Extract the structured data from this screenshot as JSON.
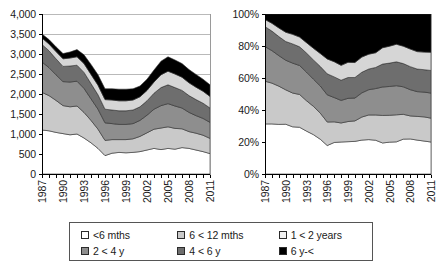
{
  "chart_data": [
    {
      "id": "absolute",
      "type": "area",
      "stacked": true,
      "title": "",
      "xlabel": "",
      "ylabel": "",
      "ylim": [
        0,
        4000
      ],
      "yticks": [
        0,
        500,
        1000,
        1500,
        2000,
        2500,
        3000,
        3500,
        4000
      ],
      "ytick_labels": [
        "0",
        "500",
        "1,000",
        "1,500",
        "2,000",
        "2,500",
        "3,000",
        "3,500",
        "4,000"
      ],
      "grid": true,
      "legend_position": "bottom",
      "x": [
        1987,
        1988,
        1989,
        1990,
        1991,
        1992,
        1993,
        1994,
        1995,
        1996,
        1997,
        1998,
        1999,
        2000,
        2001,
        2002,
        2003,
        2004,
        2005,
        2006,
        2007,
        2008,
        2009,
        2010,
        2011
      ],
      "xtick_labels": [
        "1987",
        "1990",
        "1993",
        "1996",
        "1999",
        "2002",
        "2005",
        "2008",
        "2011"
      ],
      "xticks": [
        1987,
        1990,
        1993,
        1996,
        1999,
        2002,
        2005,
        2008,
        2011
      ],
      "series": [
        {
          "name": "<6 mths",
          "color": "#ffffff",
          "values": [
            1100,
            1080,
            1040,
            1010,
            980,
            1000,
            900,
            780,
            640,
            460,
            520,
            540,
            530,
            540,
            560,
            600,
            640,
            610,
            640,
            620,
            660,
            640,
            600,
            560,
            510
          ]
        },
        {
          "name": "6<12 mths",
          "color": "#c9c9c9",
          "values": [
            940,
            880,
            800,
            700,
            700,
            700,
            640,
            560,
            480,
            380,
            340,
            320,
            330,
            340,
            380,
            430,
            480,
            540,
            540,
            520,
            470,
            420,
            420,
            410,
            380
          ]
        },
        {
          "name": "1<2 years",
          "color": "#8e8e8e",
          "values": [
            760,
            700,
            640,
            600,
            620,
            620,
            600,
            540,
            500,
            440,
            400,
            380,
            380,
            380,
            400,
            440,
            500,
            560,
            580,
            560,
            520,
            480,
            440,
            420,
            400
          ]
        },
        {
          "name": "2<4 y",
          "color": "#6e6e6e",
          "values": [
            440,
            420,
            400,
            380,
            400,
            400,
            400,
            380,
            360,
            340,
            340,
            340,
            340,
            340,
            340,
            360,
            400,
            450,
            470,
            460,
            440,
            420,
            400,
            380,
            360
          ]
        },
        {
          "name": "4<6 y",
          "color": "#d6d6d6",
          "values": [
            160,
            170,
            180,
            190,
            200,
            210,
            220,
            230,
            240,
            240,
            250,
            250,
            250,
            250,
            250,
            260,
            280,
            320,
            340,
            340,
            330,
            320,
            310,
            300,
            290
          ]
        },
        {
          "name": "6 y-<",
          "color": "#000000",
          "values": [
            100,
            110,
            120,
            130,
            150,
            180,
            220,
            250,
            260,
            270,
            280,
            290,
            290,
            280,
            270,
            280,
            300,
            340,
            360,
            350,
            340,
            330,
            320,
            300,
            290
          ]
        }
      ]
    },
    {
      "id": "percentage",
      "type": "area",
      "stacked": true,
      "title": "",
      "xlabel": "",
      "ylabel": "",
      "ylim": [
        0,
        100
      ],
      "yticks": [
        0,
        20,
        40,
        60,
        80,
        100
      ],
      "ytick_labels": [
        "0%",
        "20%",
        "40%",
        "60%",
        "80%",
        "100%"
      ],
      "grid": false,
      "legend_position": "bottom",
      "x": [
        1987,
        1988,
        1989,
        1990,
        1991,
        1992,
        1993,
        1994,
        1995,
        1996,
        1997,
        1998,
        1999,
        2000,
        2001,
        2002,
        2003,
        2004,
        2005,
        2006,
        2007,
        2008,
        2009,
        2010,
        2011
      ],
      "xtick_labels": [
        "1987",
        "1990",
        "1993",
        "1996",
        "1999",
        "2002",
        "2005",
        "2008",
        "2011"
      ],
      "xticks": [
        1987,
        1990,
        1993,
        1996,
        1999,
        2002,
        2005,
        2008,
        2011
      ],
      "series": [
        {
          "name": "<6 mths",
          "color": "#ffffff",
          "values": [
            31.3,
            31.3,
            31.0,
            31.1,
            29.5,
            29.2,
            26.8,
            24.6,
            21.7,
            17.8,
            19.7,
            20.0,
            20.2,
            20.4,
            21.2,
            21.5,
            21.1,
            19.4,
            19.9,
            20.1,
            21.8,
            21.9,
            21.2,
            20.6,
            20.0
          ]
        },
        {
          "name": "6<12 mths",
          "color": "#c9c9c9",
          "values": [
            26.7,
            25.5,
            23.9,
            21.5,
            21.1,
            20.5,
            19.0,
            17.7,
            16.3,
            14.7,
            12.9,
            11.9,
            12.6,
            12.8,
            14.4,
            15.4,
            15.8,
            17.2,
            16.8,
            16.9,
            15.5,
            14.4,
            14.8,
            15.1,
            14.9
          ]
        },
        {
          "name": "1<2 years",
          "color": "#8e8e8e",
          "values": [
            21.6,
            20.3,
            19.1,
            18.5,
            18.7,
            18.1,
            17.9,
            17.0,
            17.0,
            17.0,
            15.2,
            14.1,
            14.5,
            14.3,
            15.1,
            15.8,
            16.5,
            17.8,
            18.0,
            18.2,
            17.2,
            16.4,
            15.5,
            15.5,
            15.7
          ]
        },
        {
          "name": "2<4 y",
          "color": "#6e6e6e",
          "values": [
            12.5,
            12.2,
            11.9,
            11.7,
            12.0,
            11.7,
            11.9,
            12.0,
            12.2,
            13.1,
            12.9,
            12.6,
            13.0,
            12.8,
            12.9,
            12.9,
            13.2,
            14.3,
            14.6,
            14.9,
            14.5,
            14.4,
            14.1,
            14.0,
            14.1
          ]
        },
        {
          "name": "4<6 y",
          "color": "#d6d6d6",
          "values": [
            4.5,
            4.9,
            5.4,
            5.8,
            6.0,
            6.1,
            6.5,
            7.3,
            8.1,
            9.3,
            9.5,
            9.3,
            9.5,
            9.4,
            9.5,
            9.3,
            9.2,
            10.2,
            10.6,
            11.0,
            10.9,
            11.0,
            10.9,
            11.0,
            11.4
          ]
        },
        {
          "name": "6 y-<",
          "color": "#000000",
          "values": [
            3.4,
            5.8,
            8.7,
            11.4,
            12.7,
            14.4,
            17.9,
            21.4,
            24.7,
            28.1,
            29.8,
            32.1,
            30.2,
            30.3,
            26.9,
            25.1,
            24.2,
            21.1,
            20.1,
            18.9,
            20.1,
            21.9,
            23.5,
            23.8,
            23.9
          ]
        }
      ]
    }
  ],
  "legend": {
    "rows": [
      [
        {
          "label": "<6 mths",
          "color": "#ffffff"
        },
        {
          "label": "6 < 12 mths",
          "color": "#c9c9c9"
        },
        {
          "label": "1 < 2 years",
          "color": "#f2f2f2"
        }
      ],
      [
        {
          "label": "2 < 4 y",
          "color": "#8e8e8e"
        },
        {
          "label": "4 < 6 y",
          "color": "#6e6e6e"
        },
        {
          "label": "6 y-<",
          "color": "#000000"
        }
      ]
    ]
  }
}
